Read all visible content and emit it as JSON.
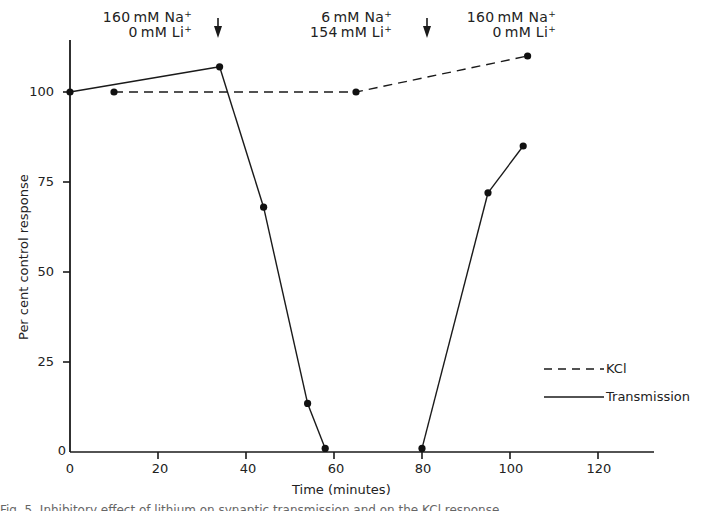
{
  "chart_data": {
    "type": "line",
    "title": "",
    "xlabel": "Time (minutes)",
    "ylabel": "Per cent control response",
    "xlim": [
      0,
      133
    ],
    "ylim": [
      0,
      113
    ],
    "xticks": [
      0,
      20,
      40,
      60,
      80,
      100,
      120
    ],
    "yticks": [
      0,
      25,
      50,
      75,
      100
    ],
    "grid": false,
    "legend_position": "lower right",
    "series": [
      {
        "name": "KCl",
        "style": "dashed",
        "x": [
          10,
          65,
          104
        ],
        "y": [
          100,
          100,
          110
        ]
      },
      {
        "name": "Transmission",
        "style": "solid",
        "x": [
          0,
          34,
          44,
          54,
          58,
          80,
          95,
          103
        ],
        "y": [
          100,
          107,
          68,
          13.5,
          1,
          1,
          72,
          85
        ]
      }
    ],
    "annotations": [
      {
        "text": "160mM Na+ / 0mM Li+",
        "period": "0-34 min"
      },
      {
        "text": "arrow (solution change)",
        "x": 34
      },
      {
        "text": "6mM Na+ / 154mM Li+",
        "period": "34-82 min"
      },
      {
        "text": "arrow (solution change)",
        "x": 82
      },
      {
        "text": "160mM Na+ / 0mM Li+",
        "period": "82+ min"
      }
    ]
  },
  "conditions": [
    {
      "line1": "160 mM  Na",
      "line2": "0 mM  Li",
      "sup": "+"
    },
    {
      "line1": "6 mM  Na",
      "line2": "154 mM  Li",
      "sup": "+"
    },
    {
      "line1": "160 mM  Na",
      "line2": "0 mM  Li",
      "sup": "+"
    }
  ],
  "axes": {
    "xlabel": "Time (minutes)",
    "ylabel": "Per cent control response",
    "xticks": [
      "0",
      "20",
      "40",
      "60",
      "80",
      "100",
      "120"
    ],
    "yticks": [
      "0",
      "25",
      "50",
      "75",
      "100"
    ]
  },
  "legend": {
    "kcl": "KCl",
    "transmission": "Transmission"
  },
  "caption": "Fig. 5. Inhibitory effect of lithium on synaptic transmission and on the KCl response"
}
